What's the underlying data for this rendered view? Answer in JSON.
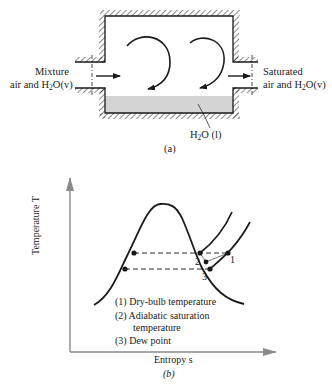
{
  "figure_a": {
    "caption": "(a)",
    "inlet_label_line1": "Mixture",
    "inlet_label_line2_prefix": "air and H",
    "inlet_label_sub": "2",
    "inlet_label_suffix": "O(v)",
    "outlet_label_line1": "Saturated",
    "outlet_label_line2_prefix": "air and H",
    "outlet_label_sub": "2",
    "outlet_label_suffix": "O(v)",
    "liquid_label_prefix": "H",
    "liquid_label_sub": "2",
    "liquid_label_suffix": "O (l)"
  },
  "figure_b": {
    "caption": "(b)",
    "y_axis_label": "Temperature T",
    "x_axis_label": "Entropy s",
    "points": [
      {
        "id": "1",
        "label": "1"
      },
      {
        "id": "2",
        "label": "2"
      },
      {
        "id": "3",
        "label": "3"
      }
    ],
    "legend": [
      "(1)  Dry-bulb temperature",
      "(2)  Adiabatic saturation",
      "temperature",
      "(3)  Dew point"
    ]
  },
  "colors": {
    "ink": "#1a1a1a",
    "water": "#d4d4d4",
    "axis": "#8a8a8a"
  }
}
